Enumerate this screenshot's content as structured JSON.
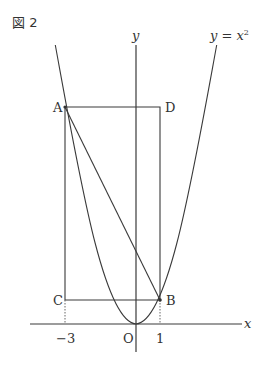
{
  "figure": {
    "label": "図 2",
    "curve_label": "y = x²",
    "curve_label_base": "y = x",
    "curve_label_exp": "2"
  },
  "axes": {
    "x_label": "x",
    "y_label": "y",
    "origin_label": "O",
    "tick_labels": {
      "neg3": "−3",
      "one": "1"
    }
  },
  "points": {
    "A": {
      "label": "A",
      "x": -3,
      "y": 9
    },
    "B": {
      "label": "B",
      "x": 1,
      "y": 1
    },
    "C": {
      "label": "C",
      "x": -3,
      "y": 1
    },
    "D": {
      "label": "D",
      "x": 1,
      "y": 9
    }
  },
  "colors": {
    "line": "#3a3a3a",
    "text": "#333333",
    "dotted": "#666666"
  }
}
